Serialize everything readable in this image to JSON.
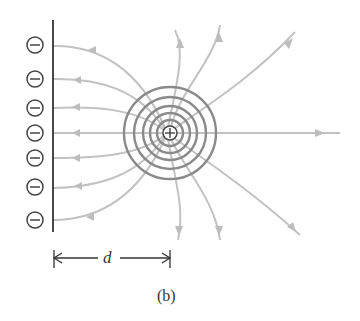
{
  "figure": {
    "caption": "(b)",
    "distance_label": "d",
    "colors": {
      "field_line": "#bdbdbd",
      "equipotential": "#8a8a8a",
      "charge_outline": "#444444",
      "plate": "#333333"
    },
    "plate": {
      "x": 53,
      "y_top": 20,
      "y_bottom": 232,
      "charge_sign": "−"
    },
    "negative_charges": [
      {
        "sign": "−",
        "y": 45
      },
      {
        "sign": "−",
        "y": 79
      },
      {
        "sign": "−",
        "y": 108
      },
      {
        "sign": "−",
        "y": 133
      },
      {
        "sign": "−",
        "y": 158
      },
      {
        "sign": "−",
        "y": 187
      },
      {
        "sign": "−",
        "y": 220
      }
    ],
    "positive_charge": {
      "sign": "+",
      "cx": 170,
      "cy": 133
    },
    "equipotential_radii": [
      8,
      15,
      23,
      35,
      46
    ]
  }
}
